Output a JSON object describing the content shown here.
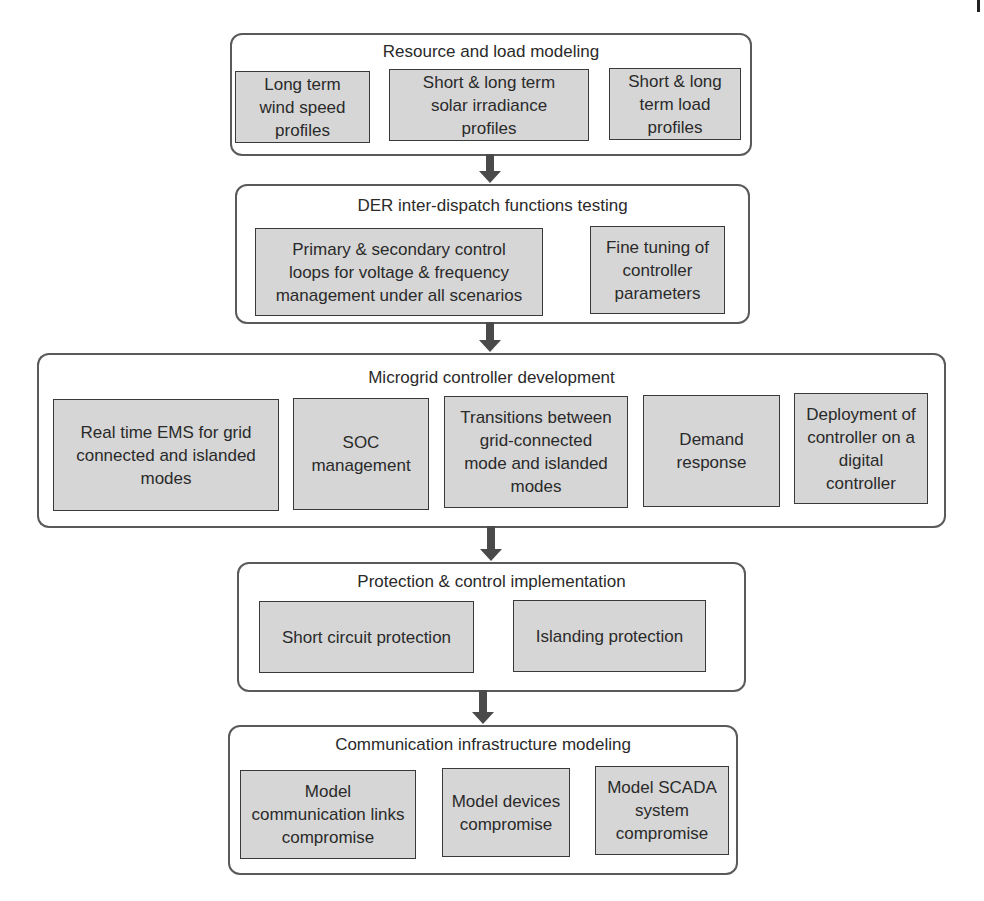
{
  "diagram": {
    "type": "flowchart",
    "direction": "top-to-bottom",
    "stages": [
      {
        "title": "Resource and load modeling",
        "items": [
          "Long term\nwind speed\nprofiles",
          "Short & long term\nsolar irradiance\nprofiles",
          "Short & long\nterm load\nprofiles"
        ]
      },
      {
        "title": "DER inter-dispatch functions testing",
        "items": [
          "Primary & secondary control\nloops for voltage & frequency\nmanagement under all scenarios",
          "Fine tuning of\ncontroller\nparameters"
        ]
      },
      {
        "title": "Microgrid controller development",
        "items": [
          "Real time EMS for grid\nconnected and islanded\nmodes",
          "SOC\nmanagement",
          "Transitions between\ngrid-connected\nmode and islanded\nmodes",
          "Demand\nresponse",
          "Deployment of\ncontroller on a\ndigital\ncontroller"
        ]
      },
      {
        "title": "Protection & control implementation",
        "items": [
          "Short circuit protection",
          "Islanding protection"
        ]
      },
      {
        "title": "Communication infrastructure modeling",
        "items": [
          "Model\ncommunication links\ncompromise",
          "Model devices\ncompromise",
          "Model SCADA\nsystem\ncompromise"
        ]
      }
    ],
    "colors": {
      "stage_border": "#5a5a5a",
      "item_fill": "#d6d6d6",
      "item_border": "#3a3a3a",
      "arrow": "#4a4a4a",
      "text": "#2a2a2a"
    }
  }
}
